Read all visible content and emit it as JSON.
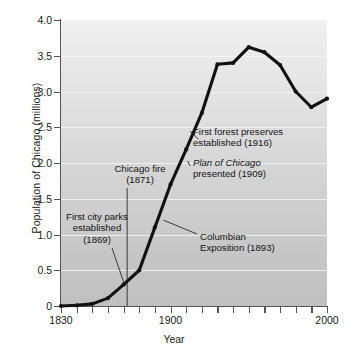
{
  "chart_data": {
    "type": "line",
    "title": "",
    "xlabel": "Year",
    "ylabel": "Population of Chicago (millions)",
    "xlim": [
      1830,
      2000
    ],
    "ylim": [
      0,
      4.0
    ],
    "grid": true,
    "legend": "none",
    "x_ticks_major": [
      1830,
      1900,
      2000
    ],
    "x_tick_labels": [
      "1830",
      "1900",
      "2000"
    ],
    "x_tick_interval_years": 10,
    "y_ticks": [
      0,
      0.5,
      1.0,
      1.5,
      2.0,
      2.5,
      3.0,
      3.5,
      4.0
    ],
    "y_tick_labels": [
      "0",
      "0.5",
      "1.0",
      "1.5",
      "2.0",
      "2.5",
      "3.0",
      "3.5",
      "4.0"
    ],
    "series": [
      {
        "name": "Population of Chicago (millions)",
        "marker": "point",
        "color": "#111111",
        "x": [
          1830,
          1840,
          1850,
          1860,
          1870,
          1880,
          1890,
          1900,
          1910,
          1920,
          1930,
          1940,
          1950,
          1960,
          1970,
          1980,
          1990,
          2000
        ],
        "values": [
          0.0,
          0.01,
          0.03,
          0.11,
          0.3,
          0.5,
          1.1,
          1.7,
          2.19,
          2.7,
          3.38,
          3.4,
          3.62,
          3.55,
          3.37,
          3.0,
          2.78,
          2.9
        ]
      }
    ],
    "annotations": [
      {
        "id": "first-forest-preserves",
        "text": "First forest preserves\nestablished (1916)",
        "year": 1916,
        "points_to_value": 2.33
      },
      {
        "id": "plan-of-chicago",
        "text_italic": "Plan of Chicago",
        "text": "presented (1909)",
        "year": 1909,
        "points_to_value": 2.05
      },
      {
        "id": "columbian-exposition",
        "text": "Columbian\nExposition (1893)",
        "year": 1893,
        "points_to_value": 1.27
      },
      {
        "id": "chicago-fire",
        "text": "Chicago fire\n(1871)",
        "year": 1871,
        "marker": "vertical-line"
      },
      {
        "id": "first-city-parks",
        "text": "First city parks\nestablished\n(1869)",
        "year": 1869,
        "points_to_value": 0.3
      }
    ]
  },
  "axes": {
    "y_title": "Population of Chicago (millions)",
    "x_title": "Year"
  },
  "annotations_text": {
    "forest_line1": "First forest preserves",
    "forest_line2": "established (1916)",
    "plan_italic": "Plan of Chicago",
    "plan_line2": "presented (1909)",
    "columbian_line1": "Columbian",
    "columbian_line2": "Exposition (1893)",
    "fire_line1": "Chicago fire",
    "fire_line2": "(1871)",
    "parks_line1": "First city parks",
    "parks_line2": "established",
    "parks_line3": "(1869)"
  },
  "colors": {
    "series": "#111111",
    "plot_bg_top": "#f0f0f0",
    "plot_bg_bottom": "#c0c0c0",
    "gridline": "#f4f4f4",
    "axis": "#555555",
    "text": "#141414"
  }
}
